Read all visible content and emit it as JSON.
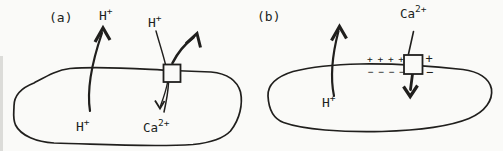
{
  "colors": {
    "background": "#fafaf8",
    "ink": "#201f1d"
  },
  "panel_a": {
    "label": "(a)",
    "proton_out": {
      "base": "H",
      "sup": "+"
    },
    "proton_antiport": {
      "base": "H",
      "sup": "+"
    },
    "proton_inside": {
      "base": "H",
      "sup": "+"
    },
    "calcium": {
      "base": "Ca",
      "sup": "2+"
    }
  },
  "panel_b": {
    "label": "(b)",
    "proton_inside": {
      "base": "H",
      "sup": "+"
    },
    "calcium": {
      "base": "Ca",
      "sup": "2+"
    },
    "charges": {
      "outside_row": "+ + + +",
      "outside_single": "+",
      "inside_row": "− − − −",
      "inside_single": "−"
    }
  }
}
